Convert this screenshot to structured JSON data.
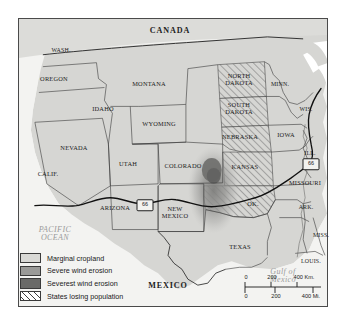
{
  "map": {
    "title": "Dust Bowl and Western United States Map",
    "countries": [
      {
        "name": "CANADA",
        "x": 152,
        "y": 13
      },
      {
        "name": "MEXICO",
        "x": 150,
        "y": 268
      }
    ],
    "waters": [
      {
        "name": "PACIFIC\nOCEAN",
        "x": 37,
        "y": 216
      },
      {
        "name": "Gulf of\nMexico",
        "x": 265,
        "y": 258
      }
    ],
    "states": [
      {
        "name": "WASH.",
        "x": 43,
        "y": 32,
        "size": "sm"
      },
      {
        "name": "OREGON",
        "x": 36,
        "y": 61,
        "size": "normal"
      },
      {
        "name": "IDAHO",
        "x": 85,
        "y": 91,
        "size": "normal"
      },
      {
        "name": "MONTANA",
        "x": 131,
        "y": 66,
        "size": "normal"
      },
      {
        "name": "WYOMING",
        "x": 141,
        "y": 106,
        "size": "normal"
      },
      {
        "name": "NEVADA",
        "x": 56,
        "y": 130,
        "size": "normal"
      },
      {
        "name": "CALIF.",
        "x": 30,
        "y": 156,
        "size": "normal"
      },
      {
        "name": "UTAH",
        "x": 110,
        "y": 146,
        "size": "normal"
      },
      {
        "name": "COLORADO",
        "x": 165,
        "y": 148,
        "size": "normal"
      },
      {
        "name": "ARIZONA",
        "x": 97,
        "y": 190,
        "size": "normal"
      },
      {
        "name": "NEW\nMEXICO",
        "x": 157,
        "y": 195,
        "size": "normal"
      },
      {
        "name": "NORTH\nDAKOTA",
        "x": 221,
        "y": 62,
        "size": "normal"
      },
      {
        "name": "SOUTH\nDAKOTA",
        "x": 221,
        "y": 91,
        "size": "normal"
      },
      {
        "name": "NEBRASKA",
        "x": 222,
        "y": 119,
        "size": "normal"
      },
      {
        "name": "KANSAS",
        "x": 227,
        "y": 149,
        "size": "normal"
      },
      {
        "name": "OK.",
        "x": 235,
        "y": 186,
        "size": "normal"
      },
      {
        "name": "TEXAS",
        "x": 222,
        "y": 229,
        "size": "normal"
      },
      {
        "name": "MINN.",
        "x": 262,
        "y": 66,
        "size": "sm"
      },
      {
        "name": "WIS.",
        "x": 288,
        "y": 91,
        "size": "sm"
      },
      {
        "name": "IOWA",
        "x": 268,
        "y": 117,
        "size": "normal"
      },
      {
        "name": "ILL.",
        "x": 292,
        "y": 135,
        "size": "sm"
      },
      {
        "name": "MISSOURI",
        "x": 287,
        "y": 165,
        "size": "normal"
      },
      {
        "name": "ARK.",
        "x": 288,
        "y": 189,
        "size": "sm"
      },
      {
        "name": "MISS.",
        "x": 303,
        "y": 217,
        "size": "sm"
      },
      {
        "name": "LOUIS.",
        "x": 293,
        "y": 243,
        "size": "sm"
      }
    ],
    "route_shields": [
      {
        "label": "66",
        "x": 127,
        "y": 187
      },
      {
        "label": "66",
        "x": 293,
        "y": 146
      }
    ]
  },
  "legend": {
    "items": [
      {
        "label": "Marginal cropland",
        "swatch": "marginal-cropland-swatch"
      },
      {
        "label": "Severe wind erosion",
        "swatch": "severe-wind-erosion-swatch"
      },
      {
        "label": "Severest wind erosion",
        "swatch": "severest-wind-erosion-swatch"
      },
      {
        "label": "States losing population",
        "swatch": "states-losing-population-swatch"
      }
    ]
  },
  "scale_bar": {
    "km": {
      "ticks": [
        "0",
        "200",
        "400"
      ],
      "unit": "Km."
    },
    "mi": {
      "ticks": [
        "0",
        "200",
        "400"
      ],
      "unit": "Mi."
    },
    "km_label": "400 Km.",
    "mi_label": "400 Mi."
  },
  "colors": {
    "land": "#d6d6d3",
    "marginal_cropland": "#d9d9d6",
    "severe_erosion": "#9a9a98",
    "severest_erosion": "#6a6a68",
    "water": "#f6f6f4",
    "border": "#3a3a3a",
    "route66": "#111111"
  }
}
